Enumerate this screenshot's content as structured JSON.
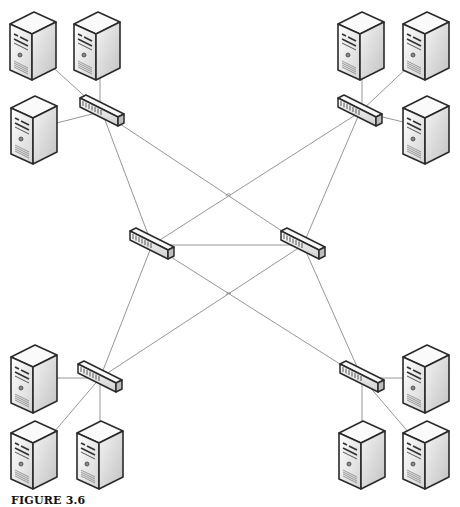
{
  "figure": {
    "caption": "FIGURE 3.6",
    "line_color": "#8a8a8a",
    "outline_color": "#2a2a2a"
  },
  "nodes": {
    "servers": [
      {
        "id": "server-tl-1",
        "x": 8,
        "y": 12
      },
      {
        "id": "server-tl-2",
        "x": 72,
        "y": 12
      },
      {
        "id": "server-tl-3",
        "x": 9,
        "y": 96
      },
      {
        "id": "server-tr-1",
        "x": 336,
        "y": 12
      },
      {
        "id": "server-tr-2",
        "x": 401,
        "y": 12
      },
      {
        "id": "server-tr-3",
        "x": 401,
        "y": 96
      },
      {
        "id": "server-bl-1",
        "x": 9,
        "y": 345
      },
      {
        "id": "server-bl-2",
        "x": 9,
        "y": 421
      },
      {
        "id": "server-bl-3",
        "x": 75,
        "y": 421
      },
      {
        "id": "server-br-1",
        "x": 401,
        "y": 345
      },
      {
        "id": "server-br-2",
        "x": 337,
        "y": 421
      },
      {
        "id": "server-br-3",
        "x": 401,
        "y": 421
      }
    ],
    "switches": [
      {
        "id": "switch-tl",
        "cx": 102,
        "cy": 112
      },
      {
        "id": "switch-tr",
        "cx": 360,
        "cy": 112
      },
      {
        "id": "switch-ml",
        "cx": 152,
        "cy": 245
      },
      {
        "id": "switch-mr",
        "cx": 303,
        "cy": 245
      },
      {
        "id": "switch-bl",
        "cx": 100,
        "cy": 378
      },
      {
        "id": "switch-br",
        "cx": 362,
        "cy": 378
      }
    ]
  },
  "links": [
    {
      "x1": 36,
      "y1": 52,
      "x2": 102,
      "y2": 112
    },
    {
      "x1": 100,
      "y1": 50,
      "x2": 100,
      "y2": 110
    },
    {
      "x1": 37,
      "y1": 128,
      "x2": 100,
      "y2": 112
    },
    {
      "x1": 102,
      "y1": 112,
      "x2": 152,
      "y2": 245
    },
    {
      "x1": 102,
      "y1": 112,
      "x2": 303,
      "y2": 245
    },
    {
      "x1": 362,
      "y1": 50,
      "x2": 362,
      "y2": 112
    },
    {
      "x1": 428,
      "y1": 48,
      "x2": 360,
      "y2": 112
    },
    {
      "x1": 428,
      "y1": 128,
      "x2": 362,
      "y2": 112
    },
    {
      "x1": 360,
      "y1": 112,
      "x2": 303,
      "y2": 245
    },
    {
      "x1": 360,
      "y1": 112,
      "x2": 152,
      "y2": 245
    },
    {
      "x1": 152,
      "y1": 245,
      "x2": 303,
      "y2": 245
    },
    {
      "x1": 152,
      "y1": 245,
      "x2": 100,
      "y2": 378
    },
    {
      "x1": 152,
      "y1": 245,
      "x2": 362,
      "y2": 378
    },
    {
      "x1": 303,
      "y1": 245,
      "x2": 100,
      "y2": 378
    },
    {
      "x1": 303,
      "y1": 245,
      "x2": 362,
      "y2": 378
    },
    {
      "x1": 37,
      "y1": 378,
      "x2": 100,
      "y2": 378
    },
    {
      "x1": 100,
      "y1": 378,
      "x2": 37,
      "y2": 452
    },
    {
      "x1": 100,
      "y1": 378,
      "x2": 100,
      "y2": 455
    },
    {
      "x1": 362,
      "y1": 378,
      "x2": 428,
      "y2": 378
    },
    {
      "x1": 362,
      "y1": 378,
      "x2": 362,
      "y2": 455
    },
    {
      "x1": 362,
      "y1": 378,
      "x2": 428,
      "y2": 455
    }
  ]
}
